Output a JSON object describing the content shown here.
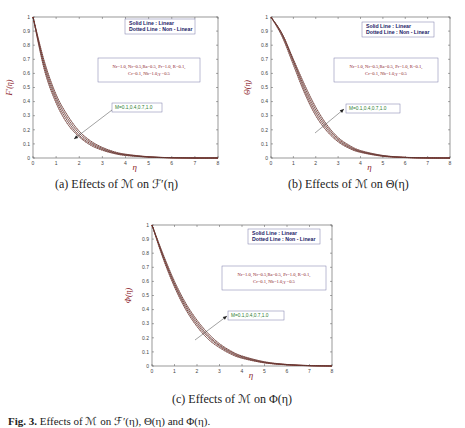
{
  "panels": [
    {
      "id": "a",
      "caption": "(a) Effects of ℳ on ℱ′(η)",
      "ylabel": "F′(η)",
      "xlabel": "η",
      "legend": {
        "line1": "Solid Line    : Linear",
        "line2": "Dotted Line  : Non - Linear"
      },
      "params": {
        "line1": "Nr=1.0, Nr=0.5,Ra=0.5, Pr=1.0, R=0.1,",
        "line2": "Cr=0.1, Nb=1.0,γ =0.5"
      },
      "m_label": "M=0.1,0.4,0.7,1.0",
      "arrow_direction": "down-left"
    },
    {
      "id": "b",
      "caption": "(b) Effects of ℳ on Θ(η)",
      "ylabel": "Θ(η)",
      "xlabel": "η",
      "legend": {
        "line1": "Solid Line    : Linear",
        "line2": "Dotted Line  : Non - Linear"
      },
      "params": {
        "line1": "Nr=1.0, Nr=0.5,Ra=0.5, Pr=1.0, R=0.1,",
        "line2": "Cr=0.1, Nb=1.0,γ =0.5"
      },
      "m_label": "M=0.1,0.4,0.7,1.0",
      "arrow_direction": "up-right"
    },
    {
      "id": "c",
      "caption": "(c) Effects of ℳ on Φ(η)",
      "ylabel": "Φ(η)",
      "xlabel": "η",
      "legend": {
        "line1": "Solid Line    : Linear",
        "line2": "Dotted Line  : Non - Linear"
      },
      "params": {
        "line1": "Nr=1.0, Nr=0.5,Ra=0.5, Pr=1.0, R=0.1,",
        "line2": "Cr=0.1, Nb=1.0,γ =0.5"
      },
      "m_label": "M=0.1,0.4,0.7,1.0",
      "arrow_direction": "up-right"
    }
  ],
  "figure_caption": {
    "prefix": "Fig. 3.",
    "text": "Effects of ℳ on ℱ′(η), Θ(η) and Φ(η)."
  },
  "colors": {
    "solid": "#333333",
    "dotted": "#c0392b",
    "legend_text": "#1a1a66",
    "param_text": "#8b1a2a",
    "m_label": "#2e7d32",
    "axis_label": "#8b1a2a"
  },
  "chart_data": [
    {
      "type": "line",
      "title": "(a) Effects of M on F'(η)",
      "xlabel": "η",
      "ylabel": "F'(η)",
      "xlim": [
        0,
        8
      ],
      "ylim": [
        0,
        1
      ],
      "xticks": [
        0,
        1,
        2,
        3,
        4,
        5,
        6,
        7,
        8
      ],
      "yticks": [
        0,
        0.1,
        0.2,
        0.3,
        0.4,
        0.5,
        0.6,
        0.7,
        0.8,
        0.9,
        1
      ],
      "grid": false,
      "legend": [
        "Solid Line : Linear",
        "Dotted Line : Non - Linear"
      ],
      "annotations": [
        "Nr=1.0, Nr=0.5,Ra=0.5, Pr=1.0, R=0.1, Cr=0.1, Nb=1.0,γ =0.5",
        "M=0.1,0.4,0.7,1.0 (arrow: increasing M decreases F')"
      ],
      "x": [
        0,
        0.5,
        1,
        1.5,
        2,
        2.5,
        3,
        3.5,
        4,
        5,
        6,
        7,
        8
      ],
      "series": [
        {
          "name": "M=0.1",
          "values": [
            1.0,
            0.68,
            0.45,
            0.3,
            0.19,
            0.12,
            0.075,
            0.045,
            0.027,
            0.009,
            0.002,
            0.0,
            0.0
          ]
        },
        {
          "name": "M=0.4",
          "values": [
            1.0,
            0.66,
            0.43,
            0.28,
            0.175,
            0.11,
            0.068,
            0.04,
            0.024,
            0.008,
            0.002,
            0.0,
            0.0
          ]
        },
        {
          "name": "M=0.7",
          "values": [
            1.0,
            0.64,
            0.41,
            0.26,
            0.16,
            0.1,
            0.061,
            0.036,
            0.021,
            0.007,
            0.002,
            0.0,
            0.0
          ]
        },
        {
          "name": "M=1.0",
          "values": [
            1.0,
            0.62,
            0.39,
            0.24,
            0.15,
            0.09,
            0.055,
            0.032,
            0.018,
            0.006,
            0.001,
            0.0,
            0.0
          ]
        }
      ]
    },
    {
      "type": "line",
      "title": "(b) Effects of M on Θ(η)",
      "xlabel": "η",
      "ylabel": "Θ(η)",
      "xlim": [
        0,
        8
      ],
      "ylim": [
        0,
        1
      ],
      "xticks": [
        0,
        1,
        2,
        3,
        4,
        5,
        6,
        7,
        8
      ],
      "yticks": [
        0,
        0.1,
        0.2,
        0.3,
        0.4,
        0.5,
        0.6,
        0.7,
        0.8,
        0.9,
        1
      ],
      "grid": false,
      "legend": [
        "Solid Line : Linear",
        "Dotted Line : Non - Linear"
      ],
      "annotations": [
        "Nr=1.0, Nr=0.5,Ra=0.5, Pr=1.0, R=0.1, Cr=0.1, Nb=1.0,γ =0.5",
        "M=0.1,0.4,0.7,1.0 (arrow: increasing M increases Θ)"
      ],
      "x": [
        0,
        0.5,
        1,
        1.5,
        2,
        2.5,
        3,
        3.5,
        4,
        5,
        6,
        7,
        8
      ],
      "series": [
        {
          "name": "M=0.1",
          "values": [
            1.0,
            0.86,
            0.66,
            0.46,
            0.3,
            0.19,
            0.115,
            0.068,
            0.04,
            0.012,
            0.003,
            0.0,
            0.0
          ]
        },
        {
          "name": "M=0.4",
          "values": [
            1.0,
            0.87,
            0.68,
            0.48,
            0.32,
            0.205,
            0.125,
            0.075,
            0.044,
            0.014,
            0.004,
            0.0,
            0.0
          ]
        },
        {
          "name": "M=0.7",
          "values": [
            1.0,
            0.88,
            0.69,
            0.5,
            0.34,
            0.22,
            0.135,
            0.082,
            0.048,
            0.016,
            0.004,
            0.001,
            0.0
          ]
        },
        {
          "name": "M=1.0",
          "values": [
            1.0,
            0.88,
            0.7,
            0.52,
            0.36,
            0.235,
            0.145,
            0.09,
            0.053,
            0.018,
            0.005,
            0.001,
            0.0
          ]
        }
      ]
    },
    {
      "type": "line",
      "title": "(c) Effects of M on Φ(η)",
      "xlabel": "η",
      "ylabel": "Φ(η)",
      "xlim": [
        0,
        8
      ],
      "ylim": [
        0,
        1
      ],
      "xticks": [
        0,
        1,
        2,
        3,
        4,
        5,
        6,
        7,
        8
      ],
      "yticks": [
        0,
        0.1,
        0.2,
        0.3,
        0.4,
        0.5,
        0.6,
        0.7,
        0.8,
        0.9,
        1
      ],
      "grid": false,
      "legend": [
        "Solid Line : Linear",
        "Dotted Line : Non - Linear"
      ],
      "annotations": [
        "Nr=1.0, Nr=0.5,Ra=0.5, Pr=1.0, R=0.1, Cr=0.1, Nb=1.0,γ =0.5",
        "M=0.1,0.4,0.7,1.0 (arrow: increasing M increases Φ)"
      ],
      "x": [
        0,
        0.5,
        1,
        1.5,
        2,
        2.5,
        3,
        3.5,
        4,
        5,
        6,
        7,
        8
      ],
      "series": [
        {
          "name": "M=0.1",
          "values": [
            1.0,
            0.76,
            0.56,
            0.4,
            0.28,
            0.19,
            0.13,
            0.085,
            0.055,
            0.022,
            0.008,
            0.002,
            0.0
          ]
        },
        {
          "name": "M=0.4",
          "values": [
            1.0,
            0.77,
            0.575,
            0.415,
            0.295,
            0.205,
            0.14,
            0.093,
            0.06,
            0.024,
            0.009,
            0.002,
            0.0
          ]
        },
        {
          "name": "M=0.7",
          "values": [
            1.0,
            0.78,
            0.585,
            0.43,
            0.31,
            0.215,
            0.148,
            0.1,
            0.066,
            0.027,
            0.01,
            0.003,
            0.0
          ]
        },
        {
          "name": "M=1.0",
          "values": [
            1.0,
            0.79,
            0.6,
            0.445,
            0.325,
            0.23,
            0.158,
            0.107,
            0.071,
            0.03,
            0.011,
            0.003,
            0.0
          ]
        }
      ]
    }
  ]
}
